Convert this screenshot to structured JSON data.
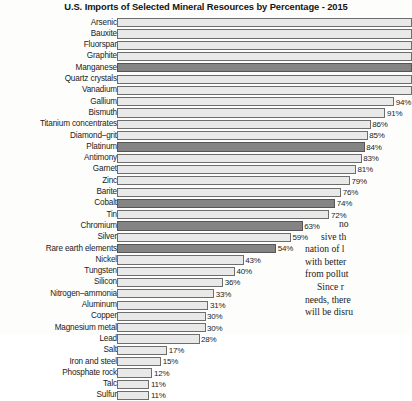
{
  "chart_data": {
    "type": "bar",
    "orientation": "horizontal",
    "title": "U.S. Imports of Selected Mineral Resources by Percentage - 2015",
    "xlabel": "",
    "ylabel": "",
    "xlim": [
      0,
      100
    ],
    "grid": false,
    "legend": null,
    "value_suffix": "%",
    "categories": [
      "Arsenic",
      "Bauxite",
      "Fluorspar",
      "Graphite",
      "Manganese",
      "Quartz crystals",
      "Vanadium",
      "Gallium",
      "Bismuth",
      "Titanium concentrates",
      "Diamond–grit",
      "Platinum",
      "Antimony",
      "Garnet",
      "Zinc",
      "Barite",
      "Cobalt",
      "Tin",
      "Chromium",
      "Silver",
      "Rare earth elements",
      "Nickel",
      "Tungsten",
      "Silicon",
      "Nitrogen–ammonia",
      "Aluminum",
      "Copper",
      "Magnesium metal",
      "Lead",
      "Salt",
      "Iron and steel",
      "Phosphate rock",
      "Talc",
      "Sulfur"
    ],
    "values": [
      100,
      100,
      100,
      100,
      100,
      100,
      100,
      94,
      91,
      86,
      85,
      84,
      83,
      81,
      79,
      76,
      74,
      72,
      63,
      59,
      54,
      43,
      40,
      36,
      33,
      31,
      30,
      30,
      28,
      17,
      15,
      12,
      11,
      11
    ],
    "value_labels": [
      "",
      "",
      "",
      "",
      "",
      "",
      "",
      "94%",
      "91%",
      "86%",
      "85%",
      "84%",
      "83%",
      "81%",
      "79%",
      "76%",
      "74%",
      "72%",
      "63%",
      "59%",
      "54%",
      "43%",
      "40%",
      "36%",
      "33%",
      "31%",
      "30%",
      "30%",
      "28%",
      "17%",
      "15%",
      "12%",
      "11%",
      "11%"
    ],
    "highlighted_indices": [
      4,
      11,
      16,
      18,
      20
    ],
    "colors": {
      "bar_light": "#e9e9e9",
      "bar_dark": "#848484",
      "bar_outline": "#6d6d6d",
      "text": "#1d1d1d",
      "background": "#fdfdfc"
    }
  },
  "body_text": {
    "lines": [
      "no",
      "sive th",
      "nation of l",
      "with better",
      "from pollut",
      "Since r",
      "needs, there",
      "will be disru"
    ]
  }
}
